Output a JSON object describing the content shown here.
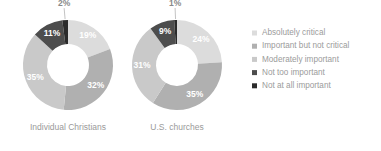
{
  "chart_data": {
    "type": "pie",
    "title": "",
    "subtitle": "",
    "legend_position": "right",
    "grid": false,
    "categories": [
      "Absolutely critical",
      "Important but not critical",
      "Moderately important",
      "Not too important",
      "Not at all important"
    ],
    "colors": [
      "#dcdcdc",
      "#b0b0b0",
      "#c9c9c9",
      "#4d4d4d",
      "#2b2b2b"
    ],
    "unit": "%",
    "series": [
      {
        "name": "Individual Christians",
        "values": [
          19,
          32,
          35,
          11,
          2
        ],
        "labels": [
          "19%",
          "32%",
          "35%",
          "11%",
          "2%"
        ]
      },
      {
        "name": "U.S. churches",
        "values": [
          24,
          35,
          31,
          9,
          1
        ],
        "labels": [
          "24%",
          "35%",
          "31%",
          "9%",
          "1%"
        ]
      }
    ]
  },
  "charts": [
    {
      "caption": "Individual Christians",
      "center_x": 68,
      "center_y": 65,
      "outer_radius": 45,
      "inner_radius": 21,
      "start_angle": 0,
      "slices": [
        {
          "category": "Absolutely critical",
          "value": 19,
          "label": "19%",
          "color": "#dcdcdc",
          "label_color": "#ffffff",
          "label_outside": false
        },
        {
          "category": "Important but not critical",
          "value": 32,
          "label": "32%",
          "color": "#b0b0b0",
          "label_color": "#ffffff",
          "label_outside": false
        },
        {
          "category": "Moderately important",
          "value": 35,
          "label": "35%",
          "color": "#c9c9c9",
          "label_color": "#ffffff",
          "label_outside": false
        },
        {
          "category": "Not too important",
          "value": 11,
          "label": "11%",
          "color": "#4d4d4d",
          "label_color": "#ffffff",
          "label_outside": false
        },
        {
          "category": "Not at all important",
          "value": 2,
          "label": "2%",
          "color": "#2b2b2b",
          "label_color": "#8a8a8a",
          "label_outside": true
        }
      ]
    },
    {
      "caption": "U.S. churches",
      "center_x": 177,
      "center_y": 65,
      "outer_radius": 45,
      "inner_radius": 21,
      "start_angle": 0,
      "slices": [
        {
          "category": "Absolutely critical",
          "value": 24,
          "label": "24%",
          "color": "#dcdcdc",
          "label_color": "#ffffff",
          "label_outside": false
        },
        {
          "category": "Important but not critical",
          "value": 35,
          "label": "35%",
          "color": "#b0b0b0",
          "label_color": "#ffffff",
          "label_outside": false
        },
        {
          "category": "Moderately important",
          "value": 31,
          "label": "31%",
          "color": "#c9c9c9",
          "label_color": "#ffffff",
          "label_outside": false
        },
        {
          "category": "Not too important",
          "value": 9,
          "label": "9%",
          "color": "#4d4d4d",
          "label_color": "#ffffff",
          "label_outside": false
        },
        {
          "category": "Not at all important",
          "value": 1,
          "label": "1%",
          "color": "#2b2b2b",
          "label_color": "#8a8a8a",
          "label_outside": true
        }
      ]
    }
  ],
  "legend": {
    "x": 252,
    "y": 33,
    "row_height": 13.2,
    "swatch_size": 5,
    "text_offset": 10,
    "items": [
      {
        "label": "Absolutely critical",
        "color": "#dcdcdc"
      },
      {
        "label": "Important but not critical",
        "color": "#b0b0b0"
      },
      {
        "label": "Moderately important",
        "color": "#c9c9c9"
      },
      {
        "label": "Not too important",
        "color": "#4d4d4d"
      },
      {
        "label": "Not at all important",
        "color": "#2b2b2b"
      }
    ]
  }
}
